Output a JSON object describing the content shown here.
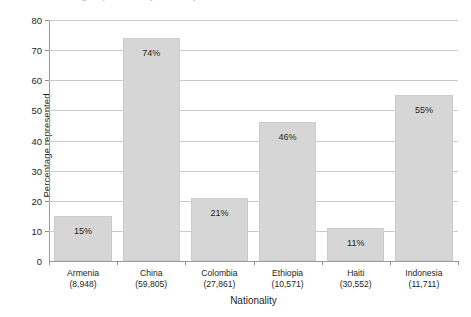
{
  "title_sliver": "Percentage represented by nationality",
  "chart_data": {
    "type": "bar",
    "title": "",
    "xlabel": "Nationality",
    "ylabel": "Percentage represented",
    "categories": [
      "Armenia",
      "China",
      "Colombia",
      "Ethiopia",
      "Haiti",
      "Indonesia"
    ],
    "category_counts": [
      "(8,948)",
      "(59,805)",
      "(27,861)",
      "(10,571)",
      "(30,552)",
      "(11,711)"
    ],
    "values": [
      15,
      74,
      21,
      46,
      11,
      55
    ],
    "value_labels": [
      "15%",
      "74%",
      "21%",
      "46%",
      "11%",
      "55%"
    ],
    "ylim": [
      0,
      80
    ],
    "yticks": [
      0,
      10,
      20,
      30,
      40,
      50,
      60,
      70,
      80
    ],
    "ytick_labels": [
      "0",
      "10",
      "20",
      "30",
      "40",
      "50",
      "60",
      "70",
      "80"
    ],
    "grid": "horizontal",
    "legend": "none",
    "bar_color": "#d6d6d6",
    "bar_edge_color": "#cccccc",
    "axis_color": "#9a9a9a",
    "grid_color": "#c9c9c9",
    "text_color": "#231f20"
  }
}
